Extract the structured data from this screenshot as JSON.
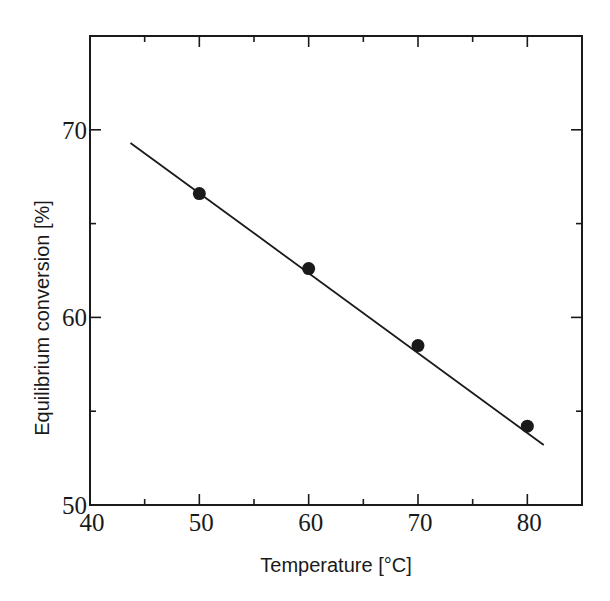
{
  "chart_data": {
    "type": "scatter",
    "title": "",
    "xlabel": "Temperature [°C]",
    "ylabel": "Equilibrium conversion [%]",
    "xlim": [
      40,
      85
    ],
    "ylim": [
      50,
      75
    ],
    "x_ticks_major": [
      40,
      50,
      60,
      70,
      80
    ],
    "x_ticks_minor": [
      45,
      55,
      65,
      75
    ],
    "y_ticks_major": [
      50,
      60,
      70
    ],
    "y_ticks_minor": [
      55,
      65
    ],
    "x_tick_labels": [
      "40",
      "50",
      "60",
      "70",
      "80"
    ],
    "y_tick_labels": [
      "50",
      "60",
      "70"
    ],
    "grid": false,
    "legend": null,
    "series": [
      {
        "name": "Measured",
        "kind": "markers",
        "marker": "filled-circle",
        "x": [
          50,
          60,
          70,
          80
        ],
        "y": [
          66.6,
          62.6,
          58.5,
          54.2
        ]
      },
      {
        "name": "Fit",
        "kind": "line",
        "x": [
          43.7,
          81.5
        ],
        "y": [
          69.3,
          53.2
        ]
      }
    ]
  },
  "colors": {
    "ink": "#1a1a1a",
    "background": "#ffffff"
  }
}
